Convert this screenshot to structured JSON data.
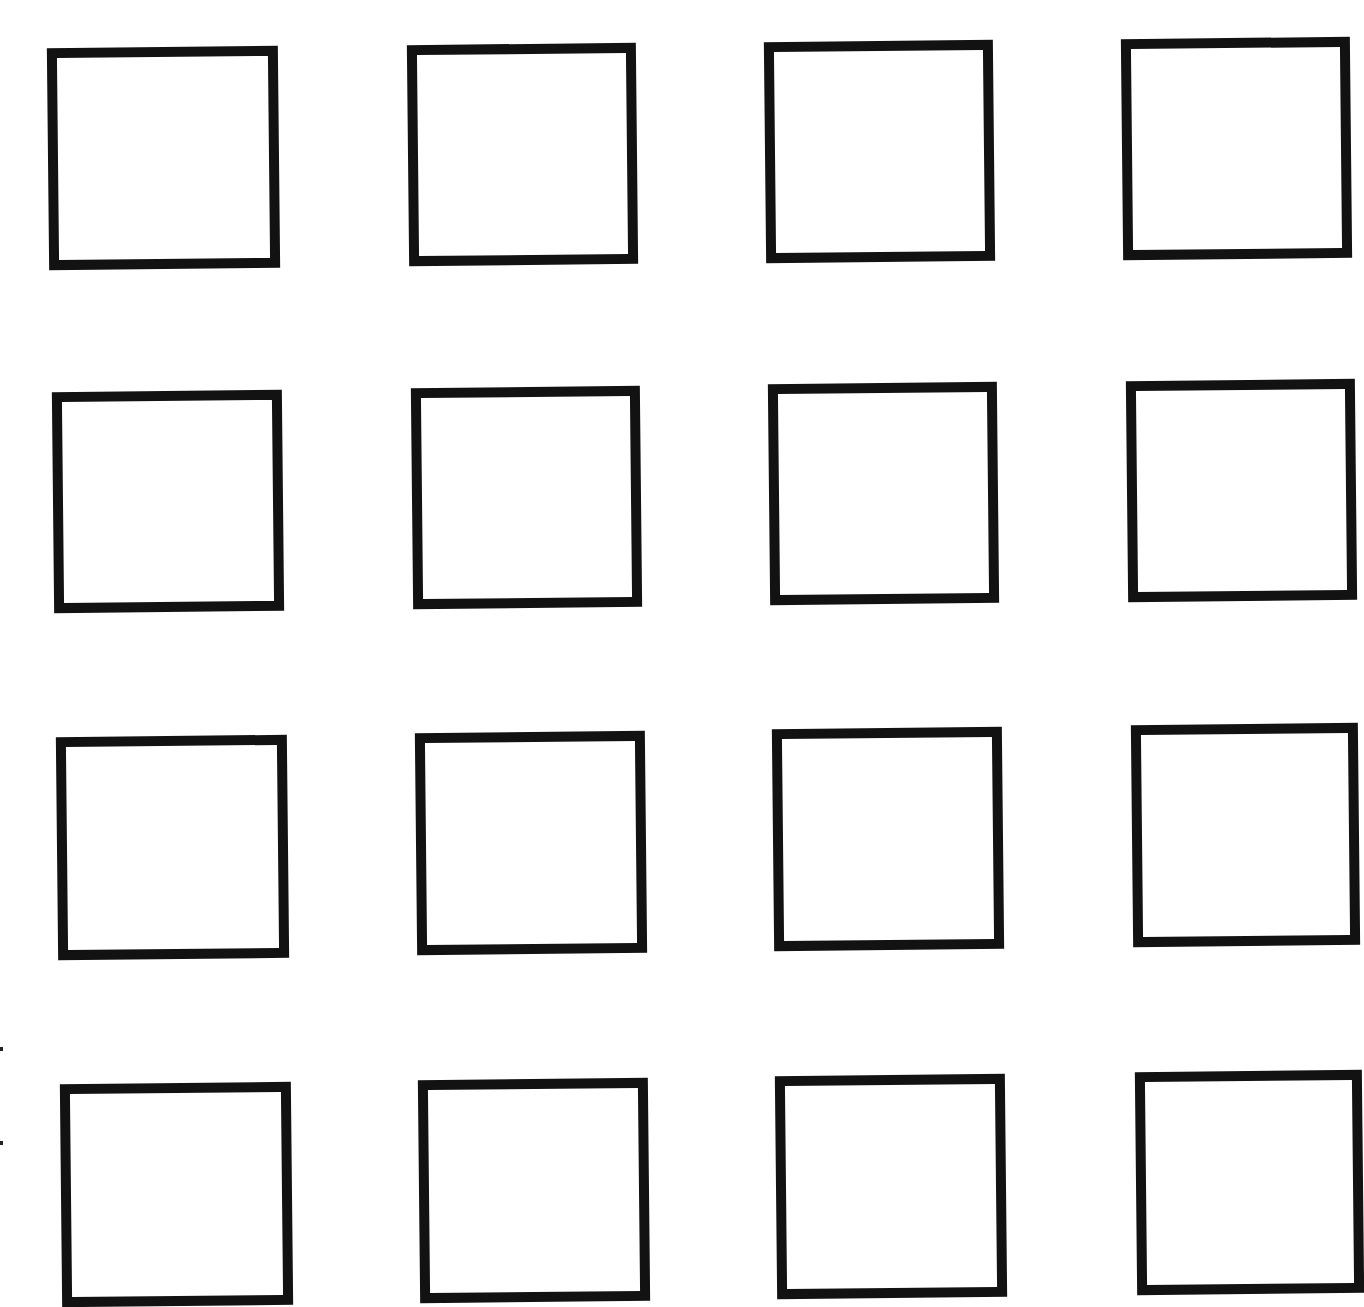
{
  "page": {
    "background": "#ffffff",
    "stroke_color": "#121212",
    "stroke_width": 10
  },
  "grid": {
    "rows": 4,
    "cols": 4,
    "boxes": [
      {
        "row": 1,
        "col": 1,
        "x": 48,
        "y": 47,
        "w": 231,
        "h": 222,
        "rot": -0.6
      },
      {
        "row": 1,
        "col": 2,
        "x": 408,
        "y": 44,
        "w": 229,
        "h": 221,
        "rot": -0.6
      },
      {
        "row": 1,
        "col": 3,
        "x": 765,
        "y": 41,
        "w": 229,
        "h": 221,
        "rot": -0.6
      },
      {
        "row": 1,
        "col": 4,
        "x": 1122,
        "y": 38,
        "w": 229,
        "h": 221,
        "rot": -0.6
      },
      {
        "row": 2,
        "col": 1,
        "x": 53,
        "y": 391,
        "w": 230,
        "h": 221,
        "rot": -0.6
      },
      {
        "row": 2,
        "col": 2,
        "x": 412,
        "y": 387,
        "w": 229,
        "h": 221,
        "rot": -0.6
      },
      {
        "row": 2,
        "col": 3,
        "x": 769,
        "y": 383,
        "w": 229,
        "h": 221,
        "rot": -0.6
      },
      {
        "row": 2,
        "col": 4,
        "x": 1127,
        "y": 380,
        "w": 229,
        "h": 221,
        "rot": -0.6
      },
      {
        "row": 3,
        "col": 1,
        "x": 57,
        "y": 736,
        "w": 231,
        "h": 223,
        "rot": -0.6
      },
      {
        "row": 3,
        "col": 2,
        "x": 416,
        "y": 732,
        "w": 230,
        "h": 222,
        "rot": -0.6
      },
      {
        "row": 3,
        "col": 3,
        "x": 773,
        "y": 728,
        "w": 230,
        "h": 222,
        "rot": -0.6
      },
      {
        "row": 3,
        "col": 4,
        "x": 1132,
        "y": 724,
        "w": 227,
        "h": 222,
        "rot": -0.6
      },
      {
        "row": 4,
        "col": 1,
        "x": 61,
        "y": 1083,
        "w": 231,
        "h": 223,
        "rot": -0.6
      },
      {
        "row": 4,
        "col": 2,
        "x": 419,
        "y": 1079,
        "w": 230,
        "h": 223,
        "rot": -0.6
      },
      {
        "row": 4,
        "col": 3,
        "x": 776,
        "y": 1075,
        "w": 230,
        "h": 223,
        "rot": -0.6
      },
      {
        "row": 4,
        "col": 4,
        "x": 1136,
        "y": 1071,
        "w": 227,
        "h": 223,
        "rot": -0.6
      }
    ]
  },
  "margin_marks": [
    {
      "x": 0,
      "y": 1047
    },
    {
      "x": 0,
      "y": 1141
    }
  ]
}
